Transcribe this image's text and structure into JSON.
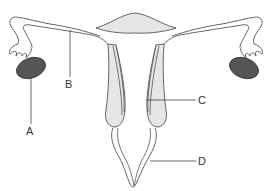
{
  "diagram": {
    "labels": [
      {
        "id": "A",
        "text": "A"
      },
      {
        "id": "B",
        "text": "B"
      },
      {
        "id": "C",
        "text": "C"
      },
      {
        "id": "D",
        "text": "D"
      }
    ],
    "colors": {
      "outline": "#555555",
      "tissue_fill": "#e6e6e6",
      "ovary_fill": "#555555",
      "leader_line": "#444444",
      "label_text": "#333333"
    }
  }
}
